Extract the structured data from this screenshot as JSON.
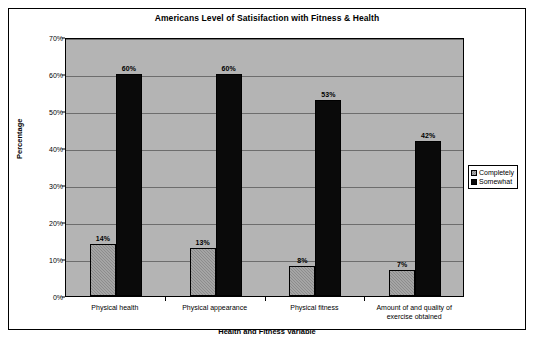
{
  "chart_data": {
    "type": "bar",
    "title": "Americans Level of Satisifaction with Fitness & Health",
    "xlabel": "Health and Fitness Variable",
    "ylabel": "Percentage",
    "categories": [
      "Physical health",
      "Physical appearance",
      "Physical fitness",
      "Amount of and quality of exercise obtained"
    ],
    "series": [
      {
        "name": "Completely",
        "values": [
          14,
          13,
          8,
          7
        ],
        "color": "#8c8c8c",
        "pattern": "hatched"
      },
      {
        "name": "Somewhat",
        "values": [
          60,
          60,
          53,
          42
        ],
        "color": "#0a0a0a",
        "pattern": "solid"
      }
    ],
    "data_labels": [
      [
        "14%",
        "60%"
      ],
      [
        "13%",
        "60%"
      ],
      [
        "8%",
        "53%"
      ],
      [
        "7%",
        "42%"
      ]
    ],
    "ylim": [
      0,
      70
    ],
    "ytick_values": [
      0,
      10,
      20,
      30,
      40,
      50,
      60,
      70
    ],
    "ytick_labels": [
      "0%",
      "10%",
      "20%",
      "30%",
      "40%",
      "50%",
      "60%",
      "70%"
    ],
    "grid": true,
    "legend_position": "right",
    "plot_background": "#b4b4b4",
    "frame_color": "#000000"
  }
}
